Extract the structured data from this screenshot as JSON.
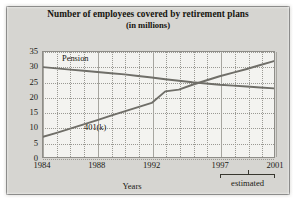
{
  "figure": {
    "title_line1": "Number of employees covered by retirement plans",
    "title_line2": "(in millions)",
    "axis_caption": "Years",
    "estimated_label": "estimated"
  },
  "chart_data": {
    "type": "line",
    "title": "Number of employees covered by retirement plans (in millions)",
    "xlabel": "Years",
    "ylabel": "",
    "units": "millions",
    "xlim": [
      1984,
      2001
    ],
    "ylim": [
      0,
      35
    ],
    "xticks": [
      1984,
      1988,
      1992,
      1997,
      2001
    ],
    "xtick_labels": [
      "1984",
      "1988",
      "1992",
      "1997",
      "2001"
    ],
    "yticks": [
      0,
      5,
      10,
      15,
      20,
      25,
      30,
      35
    ],
    "ytick_labels": [
      "0",
      "5",
      "10",
      "15",
      "20",
      "25",
      "30",
      "35"
    ],
    "grid": true,
    "legend": "inline-labels",
    "x": [
      1984,
      1985,
      1986,
      1987,
      1988,
      1989,
      1990,
      1991,
      1992,
      1993,
      1994,
      1995,
      1996,
      1997,
      1998,
      1999,
      2000,
      2001
    ],
    "series": [
      {
        "name": "Pension",
        "label": "Pension",
        "color": "#6f6e68",
        "values": [
          30.0,
          29.6,
          29.2,
          28.8,
          28.4,
          28.0,
          27.6,
          27.1,
          26.6,
          26.0,
          25.5,
          25.0,
          24.6,
          24.2,
          23.9,
          23.6,
          23.3,
          23.0
        ]
      },
      {
        "name": "401(k)",
        "label": "401(k)",
        "color": "#6f6e68",
        "values": [
          7.0,
          8.3,
          9.7,
          11.1,
          12.5,
          14.0,
          15.4,
          16.8,
          18.2,
          22.0,
          22.6,
          24.2,
          25.6,
          27.0,
          28.2,
          29.4,
          30.7,
          32.0
        ]
      }
    ],
    "annotations": [
      {
        "text": "Pension",
        "x": 1986.6,
        "y": 32.2
      },
      {
        "text": "401(k)",
        "x": 1988.2,
        "y": 11.5
      },
      {
        "text": "estimated",
        "span": [
          1997,
          2001
        ]
      }
    ]
  }
}
